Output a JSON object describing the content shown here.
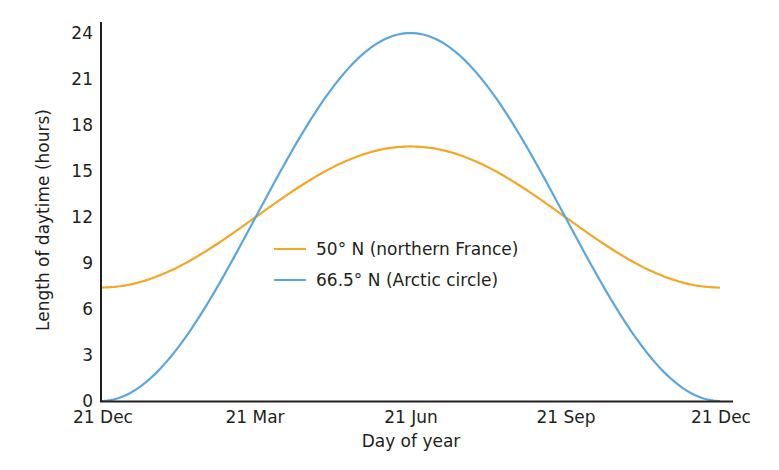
{
  "chart_data": {
    "type": "line",
    "title": "",
    "xlabel": "Day of year",
    "ylabel": "Length of daytime (hours)",
    "ylim": [
      0,
      24
    ],
    "yticks": [
      0,
      3,
      6,
      9,
      12,
      15,
      18,
      21,
      24
    ],
    "xticks": [
      "21 Dec",
      "21 Mar",
      "21 Jun",
      "21 Sep",
      "21 Dec"
    ],
    "grid": false,
    "legend_position": "center",
    "x": [
      "21 Dec",
      "21 Jan",
      "21 Feb",
      "21 Mar",
      "21 Apr",
      "21 May",
      "21 Jun",
      "21 Jul",
      "21 Aug",
      "21 Sep",
      "21 Oct",
      "21 Nov",
      "21 Dec"
    ],
    "series": [
      {
        "name": "50° N (northern France)",
        "color": "#f5a623",
        "values": [
          7.4,
          8.0,
          9.7,
          12.0,
          14.3,
          16.0,
          16.6,
          16.0,
          14.3,
          12.0,
          9.7,
          8.0,
          7.4
        ]
      },
      {
        "name": "66.5° N (Arctic circle)",
        "color": "#5aa7e0",
        "values": [
          0,
          1.6,
          6.0,
          12.0,
          18.0,
          22.4,
          24,
          22.4,
          18.0,
          12.0,
          6.0,
          1.6,
          0
        ]
      }
    ]
  },
  "axes": {
    "y_title": "Length of daytime (hours)",
    "x_title": "Day of year",
    "y_tick_labels": [
      "0",
      "3",
      "6",
      "9",
      "12",
      "15",
      "18",
      "21",
      "24"
    ],
    "x_tick_labels": [
      "21 Dec",
      "21 Mar",
      "21 Jun",
      "21 Sep",
      "21 Dec"
    ]
  },
  "legend": {
    "items": [
      {
        "label": "50° N (northern France)",
        "color": "#f5a623"
      },
      {
        "label": "66.5° N (Arctic circle)",
        "color": "#5aa7e0"
      }
    ]
  }
}
